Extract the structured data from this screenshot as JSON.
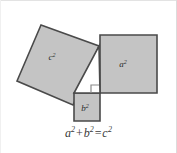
{
  "figure": {
    "name": "pythagorean-theorem-diagram",
    "caption": {
      "full": "a²+b²=c²",
      "term_a": "a",
      "term_a_exp": "2",
      "plus": "+",
      "term_b": "b",
      "term_b_exp": "2",
      "equals": "=",
      "term_c": "c",
      "term_c_exp": "2"
    },
    "squares": [
      {
        "id": "square-c",
        "label": "c",
        "exponent": "2",
        "role": "hypotenuse-square",
        "fill": "#c4c4c4",
        "stroke": "#4a4a4a",
        "points": "41,25 17,81 73,105 99,46",
        "label_x": 52,
        "label_y": 60
      },
      {
        "id": "square-a",
        "label": "a",
        "exponent": "2",
        "role": "leg-a-square",
        "fill": "#c4c4c4",
        "stroke": "#4a4a4a",
        "points": "100,35 157,35 157,93 100,93",
        "label_x": 123,
        "label_y": 67
      },
      {
        "id": "square-b",
        "label": "b",
        "exponent": "2",
        "role": "leg-b-square",
        "fill": "#c4c4c4",
        "stroke": "#4a4a4a",
        "points": "74,93 100,93 100,121 74,121",
        "label_x": 83,
        "label_y": 111
      }
    ],
    "triangle": {
      "id": "right-triangle",
      "points": "74,93 100,93 99,46",
      "fill": "#ffffff",
      "stroke": "#4a4a4a"
    },
    "right_angle_marker": {
      "id": "right-angle-marker",
      "points": "91,93 91,85 99,85",
      "stroke": "#8a8a8a"
    },
    "colors": {
      "square_fill": "#c4c4c4",
      "square_stroke": "#4a4a4a",
      "background": "#ffffff",
      "text": "#3a3a3a",
      "border": "#e3e3e3"
    }
  }
}
